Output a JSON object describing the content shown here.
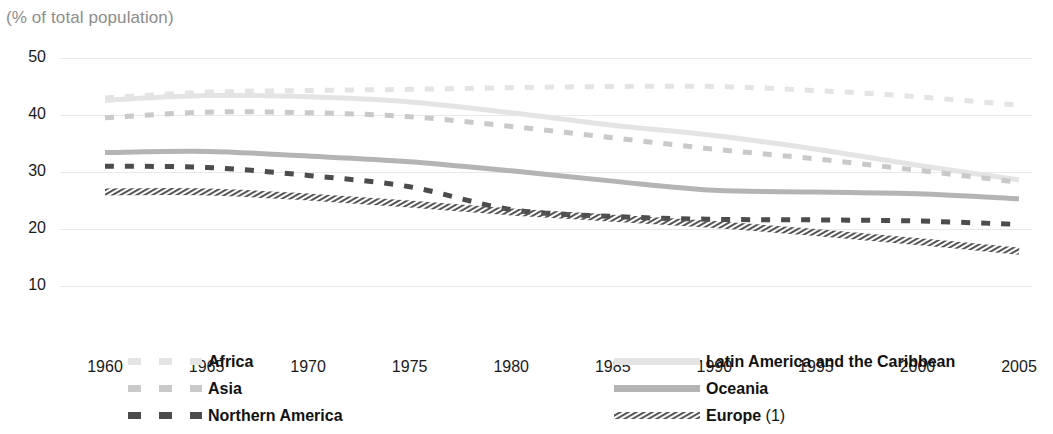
{
  "header": {
    "title_clipped": "Figure: Urban population",
    "subtitle": "(% of total population)"
  },
  "axes": {
    "y_ticks": [
      "50",
      "40",
      "30",
      "20",
      "10"
    ],
    "x_ticks": [
      "1960",
      "1965",
      "1970",
      "1975",
      "1980",
      "1985",
      "1990",
      "1995",
      "2000",
      "2005"
    ]
  },
  "legend": {
    "left": [
      {
        "label": "Africa",
        "note": "",
        "style": "dashed",
        "color": "#e4e4e4"
      },
      {
        "label": "Asia",
        "note": "",
        "style": "dashed",
        "color": "#c9c9c9"
      },
      {
        "label": "Northern America",
        "note": "",
        "style": "dashed",
        "color": "#4c4c4c"
      }
    ],
    "right": [
      {
        "label": "Latin America and the Caribbean",
        "note": "",
        "style": "solid",
        "color": "#e4e4e4"
      },
      {
        "label": "Oceania",
        "note": "",
        "style": "solid",
        "color": "#b4b4b4"
      },
      {
        "label": "Europe",
        "note": " (1)",
        "style": "hatched",
        "color": "#555555"
      }
    ]
  },
  "colors": {
    "africa": "#e4e4e4",
    "asia": "#c9c9c9",
    "northern_america": "#4c4c4c",
    "latin_america": "#e4e4e4",
    "oceania": "#b4b4b4",
    "europe": "#555555",
    "grid": "#e9e9e9",
    "text": "#1a1a1a",
    "subtitle": "#8d8d8d"
  },
  "chart_data": {
    "type": "line",
    "title": "Figure: Urban population",
    "subtitle": "(% of total population)",
    "xlabel": "",
    "ylabel": "% of total population",
    "xlim": [
      1960,
      2005
    ],
    "ylim": [
      10,
      50
    ],
    "grid": true,
    "legend_position": "bottom",
    "x": [
      1960,
      1965,
      1970,
      1975,
      1980,
      1985,
      1990,
      1995,
      2000,
      2005
    ],
    "series": [
      {
        "name": "Africa",
        "style": "dashed",
        "color": "#e4e4e4",
        "values": [
          43.0,
          44.0,
          44.3,
          44.5,
          44.8,
          45.0,
          45.0,
          44.3,
          43.2,
          41.7
        ]
      },
      {
        "name": "Asia",
        "style": "dashed",
        "color": "#c9c9c9",
        "values": [
          39.5,
          40.5,
          40.4,
          39.7,
          38.0,
          36.0,
          34.0,
          32.3,
          30.3,
          28.2
        ]
      },
      {
        "name": "Latin America and the Caribbean",
        "style": "solid",
        "color": "#e4e4e4",
        "values": [
          42.6,
          43.4,
          43.2,
          42.3,
          40.4,
          38.2,
          36.4,
          34.0,
          31.2,
          28.6
        ]
      },
      {
        "name": "Oceania",
        "style": "solid",
        "color": "#b4b4b4",
        "values": [
          33.4,
          33.6,
          32.8,
          31.8,
          30.2,
          28.4,
          26.8,
          26.5,
          26.2,
          25.3
        ]
      },
      {
        "name": "Northern America",
        "style": "dashed",
        "color": "#4c4c4c",
        "values": [
          31.0,
          30.8,
          29.4,
          27.4,
          23.4,
          22.2,
          21.7,
          21.6,
          21.4,
          20.8
        ]
      },
      {
        "name": "Europe (1)",
        "style": "hatched",
        "color": "#555555",
        "values": [
          26.5,
          26.5,
          25.6,
          24.4,
          23.0,
          21.9,
          20.8,
          19.4,
          17.8,
          16.1
        ]
      }
    ]
  }
}
